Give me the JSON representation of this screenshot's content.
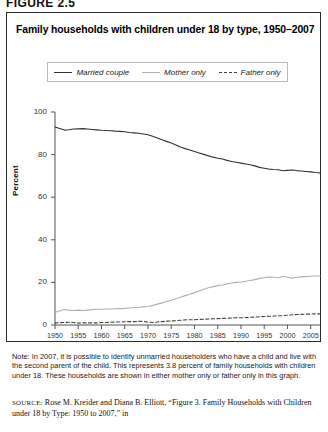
{
  "figure_label": "FIGURE 2.5",
  "chart_title": "Family households with children under 18 by type, 1950–2007",
  "legend": {
    "items": [
      {
        "label": "Married couple",
        "style": "solid",
        "color": "#333333",
        "icon": "line-solid-dark-icon"
      },
      {
        "label": "Mother only",
        "style": "solid",
        "color": "#b0b0b0",
        "icon": "line-solid-gray-icon"
      },
      {
        "label": "Father only",
        "style": "dashed",
        "color": "#444444",
        "icon": "line-dashed-icon"
      }
    ]
  },
  "note": "Note: In 2007, it is possible to identify unmarried householders who have a child and live with the second parent of the child. This represents 3.8 percent of family households with children under 18. These households are shown in either mother only or father only in this graph.",
  "source_tag": "SOURCE:",
  "source_text": " Rose M. Kreider and Diana B. Elliott, “Figure 3. Family Households with Children under 18 by Type: 1950 to 2007,” in",
  "chart_data": {
    "type": "line",
    "title": "Family households with children under 18 by type, 1950–2007",
    "xlabel": "",
    "ylabel": "Percent",
    "xlim": [
      1950,
      2007
    ],
    "ylim": [
      0,
      100
    ],
    "grid": false,
    "legend_position": "top-center",
    "xticks": [
      1950,
      1955,
      1960,
      1965,
      1970,
      1975,
      1980,
      1985,
      1990,
      1995,
      2000,
      2005
    ],
    "yticks": [
      0,
      20,
      40,
      60,
      80,
      100
    ],
    "x": [
      1950,
      1951,
      1952,
      1953,
      1954,
      1955,
      1956,
      1957,
      1958,
      1959,
      1960,
      1961,
      1962,
      1963,
      1964,
      1965,
      1966,
      1967,
      1968,
      1969,
      1970,
      1971,
      1972,
      1973,
      1974,
      1975,
      1976,
      1977,
      1978,
      1979,
      1980,
      1981,
      1982,
      1983,
      1984,
      1985,
      1986,
      1987,
      1988,
      1989,
      1990,
      1991,
      1992,
      1993,
      1994,
      1995,
      1996,
      1997,
      1998,
      1999,
      2000,
      2001,
      2002,
      2003,
      2004,
      2005,
      2006,
      2007
    ],
    "series": [
      {
        "name": "Married couple",
        "color": "#333333",
        "style": "solid",
        "values": [
          93.0,
          92.3,
          91.5,
          91.7,
          92.0,
          92.1,
          92.2,
          92.0,
          91.8,
          91.6,
          91.4,
          91.3,
          91.2,
          91.0,
          90.9,
          90.7,
          90.4,
          90.2,
          90.0,
          89.7,
          89.3,
          88.6,
          87.8,
          87.0,
          86.2,
          85.4,
          84.5,
          83.6,
          82.8,
          82.2,
          81.5,
          80.8,
          80.1,
          79.4,
          78.8,
          78.3,
          77.9,
          77.3,
          76.8,
          76.4,
          76.0,
          75.6,
          75.2,
          74.7,
          74.0,
          73.6,
          73.2,
          73.0,
          72.9,
          72.4,
          72.6,
          72.8,
          72.5,
          72.3,
          72.1,
          71.9,
          71.6,
          71.4
        ]
      },
      {
        "name": "Mother only",
        "color": "#b0b0b0",
        "style": "solid",
        "values": [
          6.0,
          6.6,
          7.3,
          7.0,
          6.8,
          7.0,
          6.8,
          7.0,
          7.2,
          7.4,
          7.4,
          7.5,
          7.5,
          7.6,
          7.7,
          7.8,
          8.0,
          8.2,
          8.3,
          8.5,
          8.7,
          9.2,
          9.8,
          10.4,
          11.0,
          11.6,
          12.3,
          13.0,
          13.8,
          14.4,
          15.2,
          16.0,
          16.8,
          17.5,
          18.0,
          18.5,
          18.8,
          19.3,
          19.7,
          20.0,
          20.2,
          20.5,
          20.9,
          21.3,
          21.9,
          22.2,
          22.5,
          22.4,
          22.2,
          22.9,
          22.4,
          22.0,
          22.4,
          22.6,
          22.8,
          22.9,
          23.0,
          23.0
        ]
      },
      {
        "name": "Father only",
        "color": "#444444",
        "style": "dashed",
        "values": [
          1.0,
          1.1,
          1.2,
          1.3,
          1.2,
          0.9,
          1.0,
          1.0,
          1.0,
          1.0,
          1.2,
          1.2,
          1.3,
          1.4,
          1.4,
          1.5,
          1.6,
          1.6,
          1.7,
          1.8,
          1.3,
          1.2,
          1.4,
          1.6,
          1.8,
          1.9,
          2.0,
          2.2,
          2.4,
          2.5,
          2.5,
          2.6,
          2.7,
          2.8,
          2.9,
          3.0,
          3.1,
          3.2,
          3.3,
          3.4,
          3.4,
          3.5,
          3.6,
          3.7,
          3.9,
          4.0,
          4.1,
          4.2,
          4.3,
          4.4,
          4.6,
          4.8,
          4.9,
          5.0,
          5.1,
          5.1,
          5.2,
          5.2
        ]
      }
    ]
  }
}
